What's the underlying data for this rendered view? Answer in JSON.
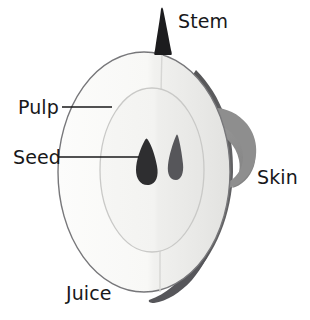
{
  "figure": {
    "background_color": "#ffffff"
  },
  "labels": {
    "stem": "Stem",
    "pulp": "Pulp",
    "seed": "Seed",
    "skin": "Skin",
    "juice": "Juice"
  },
  "colors": {
    "background": "#ffffff",
    "pulp_fill": "#f8f8f6",
    "pulp_shaded_fill": "#ededeb",
    "core_fill": "#f2f2f0",
    "outline": "#6f6f71",
    "inner_outline": "#b9b9b7",
    "seed_dark": "#2e2e30",
    "seed_light": "#56565a",
    "stem_fill": "#1c1c1e",
    "skin_dark": "#555557",
    "skin_peel": "#8c8c8c",
    "leader_line": "#18181a",
    "text": "#18181a"
  },
  "parts": [
    {
      "name": "stem",
      "label": "Stem",
      "description": "dark tapered stalk at top of apple"
    },
    {
      "name": "pulp",
      "label": "Pulp",
      "description": "pale flesh body of the apple"
    },
    {
      "name": "seed",
      "label": "Seed",
      "description": "two teardrop seeds in the core"
    },
    {
      "name": "skin",
      "label": "Skin",
      "description": "dark peel band curling off the right side"
    },
    {
      "name": "juice",
      "label": "Juice",
      "description": "liquid within the pulp, lower body"
    }
  ]
}
